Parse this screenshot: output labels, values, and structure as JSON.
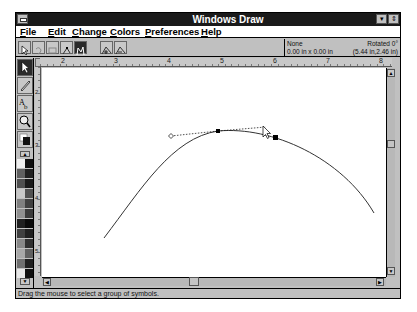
{
  "window": {
    "title": "Windows Draw",
    "minimize_glyph": "▾",
    "restore_glyph": "⇕"
  },
  "menubar": {
    "items": [
      {
        "label": "File",
        "mnemonic": "F",
        "rest": "ile"
      },
      {
        "label": "Edit",
        "mnemonic": "E",
        "rest": "dit"
      },
      {
        "label": "Change",
        "mnemonic": "C",
        "rest": "hange"
      },
      {
        "label": "Colors",
        "mnemonic": "C",
        "rest": "olors",
        "display": "Colors"
      },
      {
        "label": "Preferences",
        "mnemonic": "P",
        "rest": "references"
      },
      {
        "label": "Help",
        "mnemonic": "H",
        "rest": "elp"
      }
    ]
  },
  "toolbar": {
    "buttons": [
      "select-arrow",
      "undo",
      "rectangle",
      "node-edit",
      "curve-edit-active",
      "node-add",
      "node-delete"
    ]
  },
  "info_panel": {
    "fill": "None",
    "size": "0.00 in x 0.00 in",
    "rotation": "Rotated 0°",
    "position": "(5.44 in,2.46 in)"
  },
  "rulers": {
    "horizontal": [
      "2",
      "3",
      "4",
      "5",
      "6",
      "7",
      "8"
    ],
    "vertical": [
      "2",
      "3",
      "4",
      "5"
    ]
  },
  "toolbox": {
    "tools": [
      "pointer",
      "pencil",
      "text",
      "zoom",
      "fill-color"
    ],
    "palette_colors": [
      [
        "#f0f0f0",
        "#101010"
      ],
      [
        "#606060",
        "#202020"
      ],
      [
        "#505050",
        "#1a1a1a"
      ],
      [
        "#c8c8c8",
        "#505050"
      ],
      [
        "#808080",
        "#404040"
      ],
      [
        "#909090",
        "#3a3a3a"
      ],
      [
        "#202020",
        "#0a0a0a"
      ],
      [
        "#404040",
        "#202020"
      ],
      [
        "#888888",
        "#303030"
      ],
      [
        "#a8a8a8",
        "#606060"
      ],
      [
        "#707070",
        "#202020"
      ],
      [
        "#e8e8e8",
        "#101010"
      ]
    ]
  },
  "statusbar": {
    "text": "Drag the mouse to select a group of symbols."
  },
  "canvas": {
    "curve_path": "M 62 170 C 100 120, 130 70, 176 63 C 230 58, 300 90, 332 145",
    "handle_left": [
      129,
      68
    ],
    "anchor": [
      176,
      63
    ],
    "handle_right": [
      224,
      59
    ],
    "selected_node": [
      233,
      69
    ]
  }
}
